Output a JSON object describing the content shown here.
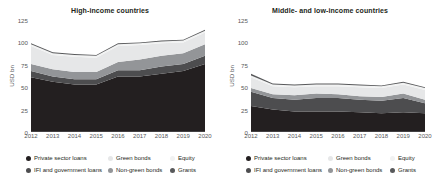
{
  "figure": {
    "ylabel": "USD bn",
    "yticks": [
      0,
      25,
      50,
      75,
      100,
      125
    ],
    "ylim": [
      0,
      125
    ],
    "xticks": [
      "2012",
      "2013",
      "2014",
      "2015",
      "2016",
      "2017",
      "2018",
      "2019",
      "2020"
    ]
  },
  "series_colors": {
    "private_sector_loans": "#231f20",
    "ifi_and_government_loans": "#4d4d4f",
    "green_bonds": "#e6e7e8",
    "non_green_bonds": "#939598",
    "equity": "#f1f2f2",
    "grants": "#58595b"
  },
  "legend": {
    "items": [
      {
        "label": "Private sector loans",
        "color_key": "private_sector_loans"
      },
      {
        "label": "Green bonds",
        "color_key": "green_bonds"
      },
      {
        "label": "Equity",
        "color_key": "equity"
      },
      {
        "label": "IFI and government loans",
        "color_key": "ifi_and_government_loans"
      },
      {
        "label": "Non-green bonds",
        "color_key": "non_green_bonds"
      },
      {
        "label": "Grants",
        "color_key": "grants"
      }
    ]
  },
  "chart_data": [
    {
      "type": "area",
      "panel_id": "high-income",
      "title": "High-income countries",
      "xlabel": "",
      "ylabel": "USD bn",
      "x": [
        "2012",
        "2013",
        "2014",
        "2015",
        "2016",
        "2017",
        "2018",
        "2019",
        "2020"
      ],
      "ylim": [
        0,
        125
      ],
      "yticks": [
        0,
        25,
        50,
        75,
        100,
        125
      ],
      "grid": false,
      "legend_position": "bottom",
      "stacked": true,
      "stack_order": [
        "Private sector loans",
        "IFI and government loans",
        "Non-green bonds",
        "Green bonds",
        "Equity",
        "Grants"
      ],
      "series": [
        {
          "name": "Private sector loans",
          "values": [
            61,
            56,
            53,
            53,
            62,
            62,
            65,
            68,
            76
          ]
        },
        {
          "name": "IFI and government loans",
          "values": [
            7,
            6,
            6,
            6,
            7,
            7,
            8,
            8,
            9
          ]
        },
        {
          "name": "Non-green bonds",
          "values": [
            8,
            8,
            8,
            8,
            9,
            12,
            12,
            12,
            13
          ]
        },
        {
          "name": "Green bonds",
          "values": [
            20,
            16,
            17,
            16,
            18,
            16,
            14,
            12,
            13
          ]
        },
        {
          "name": "Equity",
          "values": [
            2,
            2,
            2,
            2,
            2,
            2,
            2,
            2,
            2
          ]
        },
        {
          "name": "Grants",
          "values": [
            1,
            1,
            1,
            1,
            1,
            1,
            1,
            1,
            1
          ]
        }
      ],
      "totals": [
        99,
        89,
        87,
        86,
        99,
        100,
        102,
        103,
        114
      ]
    },
    {
      "type": "area",
      "panel_id": "middle-and-low-income",
      "title": "Middle- and low-income countries",
      "xlabel": "",
      "ylabel": "USD bn",
      "x": [
        "2012",
        "2013",
        "2014",
        "2015",
        "2016",
        "2017",
        "2018",
        "2019",
        "2020"
      ],
      "ylim": [
        0,
        125
      ],
      "yticks": [
        0,
        25,
        50,
        75,
        100,
        125
      ],
      "grid": false,
      "legend_position": "bottom",
      "stacked": true,
      "stack_order": [
        "Private sector loans",
        "IFI and government loans",
        "Non-green bonds",
        "Green bonds",
        "Equity",
        "Grants"
      ],
      "series": [
        {
          "name": "Private sector loans",
          "values": [
            29,
            25,
            23,
            23,
            23,
            22,
            21,
            22,
            21
          ]
        },
        {
          "name": "IFI and government loans",
          "values": [
            16,
            13,
            13,
            15,
            15,
            14,
            14,
            16,
            11
          ]
        },
        {
          "name": "Non-green bonds",
          "values": [
            4,
            4,
            5,
            5,
            4,
            4,
            4,
            5,
            4
          ]
        },
        {
          "name": "Green bonds",
          "values": [
            12,
            9,
            9,
            8,
            9,
            10,
            10,
            10,
            11
          ]
        },
        {
          "name": "Equity",
          "values": [
            2,
            2,
            2,
            2,
            2,
            2,
            2,
            2,
            2
          ]
        },
        {
          "name": "Grants",
          "values": [
            2,
            1,
            1,
            1,
            1,
            1,
            1,
            1,
            1
          ]
        }
      ],
      "totals": [
        65,
        54,
        53,
        54,
        54,
        53,
        52,
        56,
        50
      ]
    }
  ]
}
